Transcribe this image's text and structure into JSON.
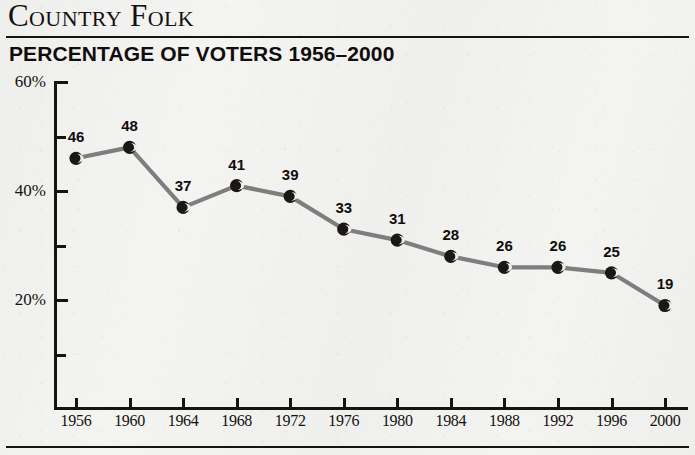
{
  "header": {
    "title": "Country Folk",
    "subtitle": "PERCENTAGE OF VOTERS 1956–2000"
  },
  "chart_data": {
    "type": "line",
    "title": "Country Folk",
    "subtitle": "PERCENTAGE OF VOTERS 1956–2000",
    "xlabel": "",
    "ylabel": "",
    "categories": [
      "1956",
      "1960",
      "1964",
      "1968",
      "1972",
      "1976",
      "1980",
      "1984",
      "1988",
      "1992",
      "1996",
      "2000"
    ],
    "values": [
      46,
      48,
      37,
      41,
      39,
      33,
      31,
      28,
      26,
      26,
      25,
      19
    ],
    "point_labels": [
      "46",
      "48",
      "37",
      "41",
      "39",
      "33",
      "31",
      "28",
      "26",
      "26",
      "25",
      "19"
    ],
    "ylim": [
      0,
      60
    ],
    "y_ticks": [
      60,
      50,
      40,
      30,
      20,
      10
    ],
    "y_tick_labels": [
      "60%",
      "",
      "40%",
      "",
      "20%",
      ""
    ],
    "y_major_labels": [
      "60%",
      "40%",
      "20%"
    ],
    "grid": false,
    "legend": "none",
    "series_color": "#7e7e7e",
    "marker_color": "#1a1714",
    "axis_color": "#17130f",
    "background_color": "#f3f3f1"
  }
}
